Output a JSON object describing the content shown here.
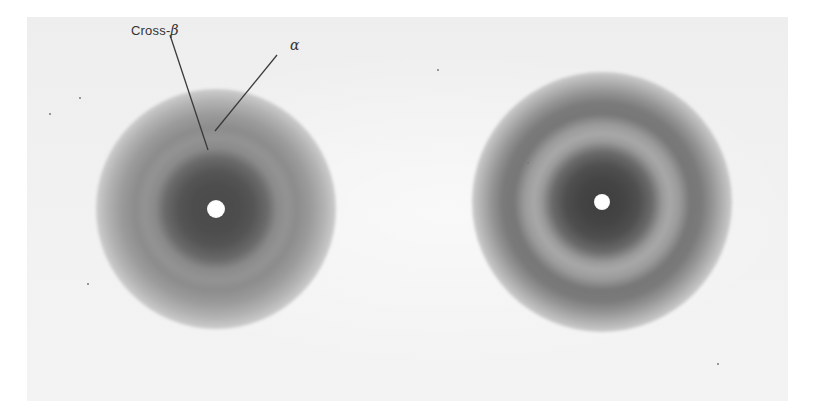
{
  "figure": {
    "panels": [
      {
        "name": "left-pattern",
        "rings_labeled": true
      },
      {
        "name": "right-pattern",
        "rings_labeled": false
      }
    ],
    "labels": {
      "cross_beta_text": "Cross-",
      "cross_beta_symbol": "β",
      "alpha_symbol": "α"
    },
    "colors": {
      "background": "#efefef",
      "ring_dark": "#444444",
      "label_text": "#333333",
      "beamstop": "#ffffff"
    }
  }
}
